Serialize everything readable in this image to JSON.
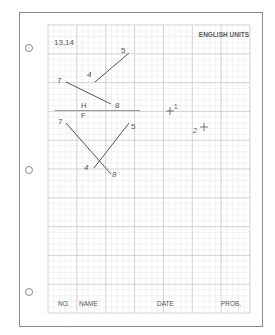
{
  "sheet": {
    "header_left": "13,14",
    "header_right": "ENGLISH UNITS",
    "folding_line": {
      "top_label": "H",
      "bottom_label": "F"
    },
    "top_view": {
      "line_45": {
        "start_label": "4",
        "end_label": "5"
      },
      "line_78": {
        "start_label": "7",
        "end_label": "8"
      }
    },
    "front_view": {
      "line_78": {
        "start_label": "7",
        "end_label": "8"
      },
      "line_45": {
        "start_label": "4",
        "end_label": "5"
      }
    },
    "points": [
      {
        "label": "1",
        "marker": "+"
      },
      {
        "label": "2",
        "marker": "+"
      }
    ],
    "title_block": {
      "no": "NO.",
      "name": "NAME",
      "date": "DATE",
      "prob": "PROB."
    }
  },
  "colors": {
    "border": "#8a8a8a",
    "major_grid": "#c6c6c6",
    "minor_grid": "#ebebeb",
    "ink": "#555555"
  }
}
